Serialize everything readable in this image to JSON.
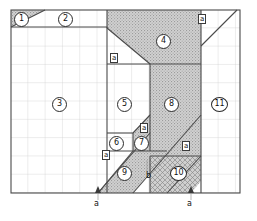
{
  "figure": {
    "type": "technical-drawing",
    "canvas": {
      "width": 257,
      "height": 221
    },
    "plot_area": {
      "x": 11,
      "y": 10,
      "width": 229,
      "height": 183
    },
    "grid": {
      "cell": 17.3,
      "cols": 13,
      "rows": 10,
      "visible": true,
      "line_color": "#c9c9c9",
      "border_color": "#4a4a4a"
    },
    "fills": {
      "hatch": "#b5b5b5",
      "plain": "#ffffff",
      "crosshatch": "#a9a9a9",
      "line": "#4a4a4a"
    }
  },
  "regions": [
    {
      "id": 1,
      "label": "1",
      "shading": "hatch",
      "x": 17,
      "y": 14
    },
    {
      "id": 2,
      "label": "2",
      "shading": "plain",
      "x": 61,
      "y": 14
    },
    {
      "id": 3,
      "label": "3",
      "shading": "plain",
      "x": 55,
      "y": 100
    },
    {
      "id": 4,
      "label": "4",
      "shading": "hatch",
      "x": 159,
      "y": 37
    },
    {
      "id": 5,
      "label": "5",
      "shading": "plain",
      "x": 120,
      "y": 100
    },
    {
      "id": 6,
      "label": "6",
      "shading": "plain",
      "x": 112,
      "y": 139
    },
    {
      "id": 7,
      "label": "7",
      "shading": "hatch",
      "x": 137,
      "y": 139
    },
    {
      "id": 8,
      "label": "8",
      "shading": "hatch",
      "x": 167,
      "y": 100
    },
    {
      "id": 9,
      "label": "9",
      "shading": "hatch",
      "x": 120,
      "y": 169
    },
    {
      "id": 10,
      "label": "10",
      "shading": "crosshatch",
      "x": 173,
      "y": 169
    },
    {
      "id": 11,
      "label": "11",
      "shading": "plain",
      "x": 214,
      "y": 100
    }
  ],
  "dimension_labels": [
    {
      "text": "a",
      "x": 112,
      "y": 55,
      "boxed": true,
      "name": "dim-a-upper-left"
    },
    {
      "text": "a",
      "x": 200,
      "y": 16,
      "boxed": true,
      "name": "dim-a-top-right"
    },
    {
      "text": "a",
      "x": 142,
      "y": 125,
      "boxed": true,
      "name": "dim-a-region7"
    },
    {
      "text": "a",
      "x": 184,
      "y": 143,
      "boxed": true,
      "name": "dim-a-right-mid"
    },
    {
      "text": "a",
      "x": 104,
      "y": 152,
      "boxed": true,
      "name": "dim-a-left-lower"
    },
    {
      "text": "b",
      "x": 147,
      "y": 174,
      "boxed": false,
      "name": "dim-b-lower"
    },
    {
      "text": "a",
      "x": 95,
      "y": 202,
      "boxed": false,
      "name": "dim-a-axis-left"
    },
    {
      "text": "a",
      "x": 188,
      "y": 202,
      "boxed": false,
      "name": "dim-a-axis-right"
    }
  ],
  "markers": [
    {
      "name": "axis-arrow-left",
      "x": 98,
      "y": 190
    },
    {
      "name": "axis-arrow-right",
      "x": 191,
      "y": 190
    }
  ]
}
